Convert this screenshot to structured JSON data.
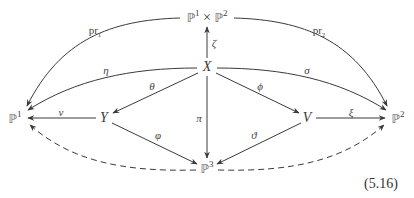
{
  "diagram": {
    "type": "commutative-diagram",
    "equation_number": "(5.16)",
    "nodes": {
      "p1xp2": {
        "base1": "ℙ",
        "exp1": "1",
        "times": "×",
        "base2": "ℙ",
        "exp2": "2",
        "x": 207,
        "y": 17
      },
      "X": {
        "label": "X",
        "x": 207,
        "y": 67
      },
      "P1": {
        "base": "ℙ",
        "exp": "1",
        "x": 17,
        "y": 118
      },
      "Y": {
        "label": "Y",
        "x": 104,
        "y": 118
      },
      "V": {
        "label": "V",
        "x": 307,
        "y": 118
      },
      "P2": {
        "base": "ℙ",
        "exp": "2",
        "x": 396,
        "y": 118
      },
      "P3": {
        "base": "ℙ",
        "exp": "3",
        "x": 207,
        "y": 168
      }
    },
    "arrows": [
      {
        "from": "p1xp2",
        "to": "P1",
        "label": "pr",
        "label_sub": "1",
        "style": "solid"
      },
      {
        "from": "p1xp2",
        "to": "P2",
        "label": "pr",
        "label_sub": "2",
        "style": "solid"
      },
      {
        "from": "X",
        "to": "p1xp2",
        "label": "ζ",
        "style": "solid"
      },
      {
        "from": "X",
        "to": "P1",
        "label": "η",
        "style": "solid"
      },
      {
        "from": "X",
        "to": "P2",
        "label": "σ",
        "style": "solid"
      },
      {
        "from": "X",
        "to": "Y",
        "label": "θ",
        "style": "solid"
      },
      {
        "from": "X",
        "to": "V",
        "label": "ϕ",
        "style": "solid"
      },
      {
        "from": "X",
        "to": "P3",
        "label": "π",
        "style": "solid"
      },
      {
        "from": "Y",
        "to": "P1",
        "label": "ν",
        "style": "solid"
      },
      {
        "from": "V",
        "to": "P2",
        "label": "ξ",
        "style": "solid"
      },
      {
        "from": "Y",
        "to": "P3",
        "label": "φ",
        "style": "solid"
      },
      {
        "from": "V",
        "to": "P3",
        "label": "ϑ",
        "style": "solid"
      },
      {
        "from": "P3",
        "to": "P1",
        "label": "",
        "style": "dashed"
      },
      {
        "from": "P3",
        "to": "P2",
        "label": "",
        "style": "dashed"
      }
    ]
  }
}
